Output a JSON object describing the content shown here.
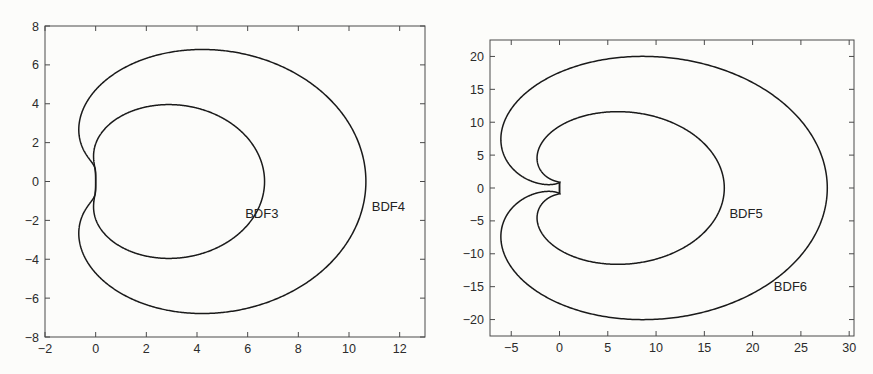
{
  "figure": {
    "background_color": "#fcfcfa",
    "line_color": "#1a1a1a",
    "axis_color": "#4a4a4a",
    "panel_count": 2
  },
  "chart_data": [
    {
      "type": "line",
      "title": "",
      "subtitle": "",
      "xlabel": "",
      "ylabel": "",
      "grid": false,
      "legend_position": "inline-annotation",
      "xlim": [
        -2,
        13
      ],
      "ylim": [
        -8,
        8
      ],
      "xticks": [
        -2,
        0,
        2,
        4,
        6,
        8,
        10,
        12
      ],
      "xticklabels": [
        "-2",
        "0",
        "2",
        "4",
        "6",
        "8",
        "10",
        "12"
      ],
      "yticks": [
        -8,
        -6,
        -4,
        -2,
        0,
        2,
        4,
        6,
        8
      ],
      "yticklabels": [
        "-8",
        "-6",
        "-4",
        "-2",
        "0",
        "2",
        "4",
        "6",
        "8"
      ],
      "series": [
        {
          "name": "BDF3",
          "annotation": "BDF3",
          "annotation_xy": [
            5.9,
            -1.9
          ],
          "description": "Boundary locus of the BDF3 stability region: z(t)=sum_{j=1..3}(1/j)(1-e^{-i t})^j",
          "order": 3,
          "extent_x": [
            -0.55,
            6.6
          ],
          "extent_y": [
            -3.95,
            3.95
          ]
        },
        {
          "name": "BDF4",
          "annotation": "BDF4",
          "annotation_xy": [
            10.9,
            -1.5
          ],
          "description": "Boundary locus of the BDF4 stability region: z(t)=sum_{j=1..4}(1/j)(1-e^{-i t})^j",
          "order": 4,
          "extent_x": [
            -0.7,
            10.7
          ],
          "extent_y": [
            -6.8,
            6.8
          ]
        }
      ]
    },
    {
      "type": "line",
      "title": "",
      "subtitle": "",
      "xlabel": "",
      "ylabel": "",
      "grid": false,
      "legend_position": "inline-annotation",
      "xlim": [
        -7.2,
        30.5
      ],
      "ylim": [
        -22.5,
        22.5
      ],
      "xticks": [
        -5,
        0,
        5,
        10,
        15,
        20,
        25,
        30
      ],
      "xticklabels": [
        "-5",
        "0",
        "5",
        "10",
        "15",
        "20",
        "25",
        "30"
      ],
      "yticks": [
        -20,
        -15,
        -10,
        -5,
        0,
        5,
        10,
        15,
        20
      ],
      "yticklabels": [
        "-20",
        "-15",
        "-10",
        "-5",
        "0",
        "5",
        "10",
        "15",
        "20"
      ],
      "series": [
        {
          "name": "BDF5",
          "annotation": "BDF5",
          "annotation_xy": [
            17.6,
            -4.6
          ],
          "description": "Boundary locus of the BDF5 stability region: z(t)=sum_{j=1..5}(1/j)(1-e^{-i t})^j",
          "order": 5,
          "extent_x": [
            -1.9,
            17.1
          ],
          "extent_y": [
            -11.6,
            11.6
          ]
        },
        {
          "name": "BDF6",
          "annotation": "BDF6",
          "annotation_xy": [
            22.2,
            -15.7
          ],
          "description": "Boundary locus of the BDF6 stability region: z(t)=sum_{j=1..6}(1/j)(1-e^{-i t})^j",
          "order": 6,
          "extent_x": [
            -5.8,
            27.8
          ],
          "extent_y": [
            -20.1,
            20.1
          ]
        }
      ]
    }
  ],
  "panels": [
    {
      "id": "left",
      "curve_labels": [
        "BDF3",
        "BDF4"
      ]
    },
    {
      "id": "right",
      "curve_labels": [
        "BDF5",
        "BDF6"
      ]
    }
  ]
}
